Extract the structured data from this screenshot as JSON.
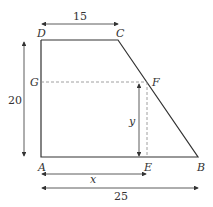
{
  "figure": {
    "shape": "trapezium ABCD",
    "vertices": {
      "A": "A",
      "B": "B",
      "C": "C",
      "D": "D",
      "E": "E",
      "F": "F",
      "G": "G"
    },
    "dimensions": {
      "top_DC": "15",
      "height_AD": "20",
      "base_AB": "25",
      "AE": "x",
      "EF": "y"
    },
    "colors": {
      "line": "#333333",
      "dashed": "#888888"
    }
  }
}
